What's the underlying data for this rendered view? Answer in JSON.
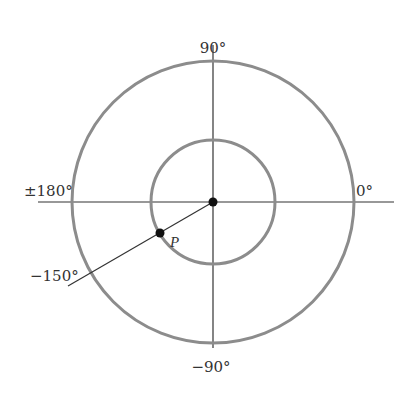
{
  "diagram": {
    "type": "polar-angle-diagram",
    "center": {
      "x": 213,
      "y": 202
    },
    "outer_circle": {
      "r": 141,
      "stroke": "#8c8c8c",
      "stroke_width": 3
    },
    "inner_circle": {
      "r": 62,
      "stroke": "#8c8c8c",
      "stroke_width": 3
    },
    "axis_color": "#333333",
    "labels": {
      "top": "90°",
      "bottom": "−90°",
      "left": "±180°",
      "right": "0°",
      "ray": "−150°",
      "point": "P"
    },
    "ray": {
      "angle_deg": -150,
      "end": {
        "x": 68,
        "y": 286
      }
    },
    "point_p": {
      "x": 160,
      "y": 233
    },
    "dot_color": "#111111"
  }
}
